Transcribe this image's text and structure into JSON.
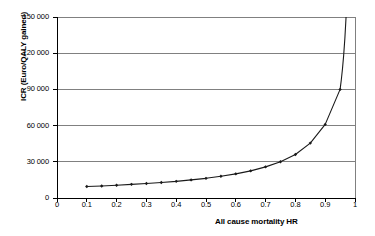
{
  "chart_data": {
    "type": "line",
    "title": "",
    "xlabel": "All cause mortality HR",
    "ylabel": "ICR (Euro/QALY gained)",
    "xlim": [
      0,
      1
    ],
    "ylim": [
      0,
      150000
    ],
    "grid": true,
    "grid_axis": "y",
    "legend": "none",
    "marker": "filled-diamond",
    "x_tick_labels": [
      "0",
      "0.1",
      "0.2",
      "0.3",
      "0.4",
      "0.5",
      "0.6",
      "0.7",
      "0.8",
      "0.9",
      "1"
    ],
    "x_tick_values": [
      0,
      0.1,
      0.2,
      0.3,
      0.4,
      0.5,
      0.6,
      0.7,
      0.8,
      0.9,
      1
    ],
    "y_tick_labels": [
      "0",
      "30 000",
      "60 000",
      "90 000",
      "120 000",
      "150 000"
    ],
    "y_tick_values": [
      0,
      30000,
      60000,
      90000,
      120000,
      150000
    ],
    "series": [
      {
        "name": "ICER",
        "x": [
          0.1,
          0.15,
          0.2,
          0.25,
          0.3,
          0.35,
          0.4,
          0.45,
          0.5,
          0.55,
          0.6,
          0.65,
          0.7,
          0.75,
          0.8,
          0.85,
          0.9,
          0.95
        ],
        "values": [
          9500,
          10000,
          10600,
          11300,
          12000,
          12900,
          13800,
          15000,
          16300,
          18000,
          20000,
          22500,
          25800,
          30000,
          36000,
          45500,
          61000,
          90000
        ]
      }
    ],
    "annotations": [
      "curve rises asymptotically and exits top of plot frame near HR = 0.97"
    ]
  },
  "colors": {
    "axis": "#000000",
    "gridline": "#808080",
    "series": "#1a1a1a",
    "background": "#ffffff"
  }
}
